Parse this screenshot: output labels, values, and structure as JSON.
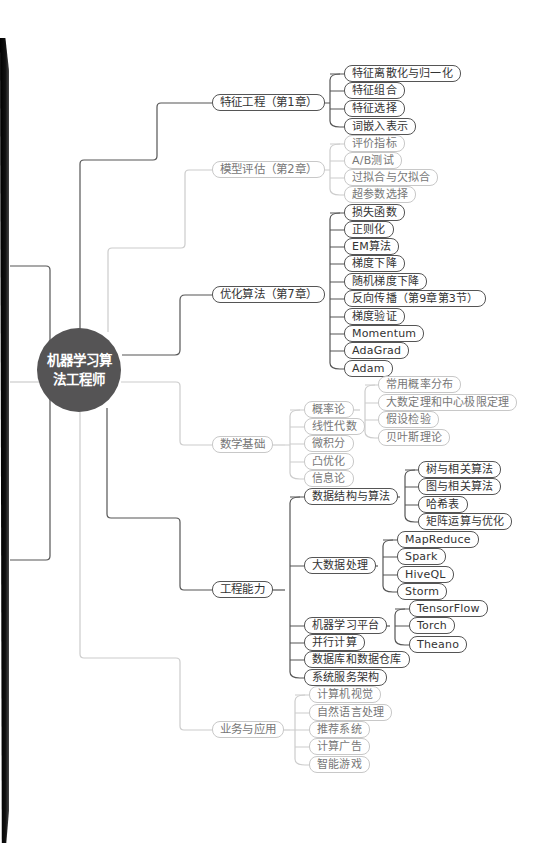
{
  "root": {
    "label": "机器学习算法工程师"
  },
  "branches": [
    {
      "label": "特征工程（第1章）",
      "children": [
        "特征离散化与归一化",
        "特征组合",
        "特征选择",
        "词嵌入表示"
      ]
    },
    {
      "label": "模型评估（第2章）",
      "children": [
        "评价指标",
        "A/B测试",
        "过拟合与欠拟合",
        "超参数选择"
      ]
    },
    {
      "label": "优化算法（第7章）",
      "children": [
        "损失函数",
        "正则化",
        "EM算法",
        "梯度下降",
        "随机梯度下降",
        "反向传播（第9章第3节）",
        "梯度验证",
        "Momentum",
        "AdaGrad",
        "Adam"
      ]
    },
    {
      "label": "数学基础",
      "children": [
        {
          "label": "概率论",
          "children": [
            "常用概率分布",
            "大数定理和中心极限定理",
            "假设检验",
            "贝叶斯理论"
          ]
        },
        {
          "label": "线性代数"
        },
        {
          "label": "微积分"
        },
        {
          "label": "凸优化"
        },
        {
          "label": "信息论"
        }
      ]
    },
    {
      "label": "工程能力",
      "children": [
        {
          "label": "数据结构与算法",
          "children": [
            "树与相关算法",
            "图与相关算法",
            "哈希表",
            "矩阵运算与优化"
          ]
        },
        {
          "label": "大数据处理",
          "children": [
            "MapReduce",
            "Spark",
            "HiveQL",
            "Storm"
          ]
        },
        {
          "label": "机器学习平台",
          "children": [
            "TensorFlow",
            "Torch",
            "Theano"
          ]
        },
        {
          "label": "并行计算"
        },
        {
          "label": "数据库和数据仓库"
        },
        {
          "label": "系统服务架构"
        }
      ]
    },
    {
      "label": "业务与应用",
      "children": [
        "计算机视觉",
        "自然语言处理",
        "推荐系统",
        "计算广告",
        "智能游戏"
      ]
    }
  ],
  "colors": {
    "root_fill": "#555455",
    "dark_line": "#555555",
    "light_line": "#c8c8c8",
    "binding": "#000000"
  }
}
